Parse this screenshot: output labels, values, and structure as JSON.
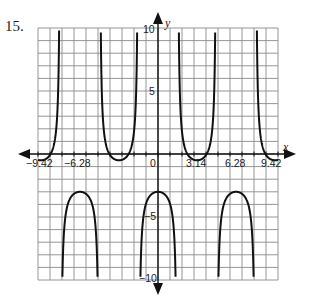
{
  "problem": {
    "number": "15."
  },
  "chart_data": {
    "type": "line",
    "title": "",
    "xlabel": "x",
    "ylabel": "y",
    "function_estimate": "y = -1.25*sec(x) - 1.75",
    "xlim": [
      -9.7,
      9.7
    ],
    "ylim": [
      -10,
      10
    ],
    "grid": true,
    "x_tick_labels": [
      "-9.42",
      "-6.28",
      "0",
      "3.14",
      "6.28",
      "9.42"
    ],
    "x_tick_values": [
      -9.42,
      -6.28,
      0,
      3.14,
      6.28,
      9.42
    ],
    "y_tick_labels": [
      "10",
      "5",
      "-5",
      "-10"
    ],
    "y_tick_values": [
      10,
      5,
      -5,
      -10
    ],
    "vertical_asymptotes": [
      -7.85,
      -4.71,
      -1.57,
      1.57,
      4.71,
      7.85
    ],
    "local_minima": [
      {
        "x": -9.42,
        "y": -0.5
      },
      {
        "x": -3.14,
        "y": -0.5
      },
      {
        "x": 3.14,
        "y": -0.5
      },
      {
        "x": 9.42,
        "y": -0.5
      }
    ],
    "local_maxima": [
      {
        "x": -6.28,
        "y": -3.0
      },
      {
        "x": 0,
        "y": -3.0
      },
      {
        "x": 6.28,
        "y": -3.0
      }
    ],
    "legend": []
  },
  "labels": {
    "x_axis": "x",
    "y_axis": "y",
    "xt0": "−9.42",
    "xt1": "−6.28",
    "xt2": "0",
    "xt3": "3.14",
    "xt4": "6.28",
    "xt5": "9.42",
    "yt0": "10",
    "yt1": "5",
    "yt2": "−5",
    "yt3": "−10"
  },
  "colors": {
    "grid": "#8a8a8a",
    "axis": "#111111",
    "curve": "#111111"
  }
}
